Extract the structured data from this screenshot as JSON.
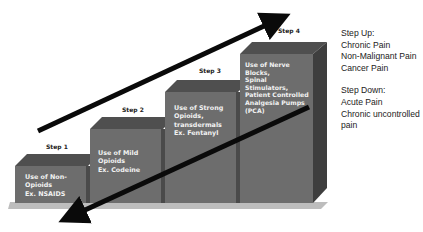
{
  "diagram": {
    "type": "staircase",
    "colors": {
      "front_face": "#6d6d6d",
      "top_face": "#4f4f4f",
      "side_face": "#3e3e3e",
      "base": "#bdbdbd",
      "arrow": "#0a0a0a",
      "block_text": "#f2f2f2"
    },
    "steps": [
      {
        "label": "Step 1",
        "lines": [
          "Use of Non-",
          "Opioids",
          "Ex. NSAIDS"
        ]
      },
      {
        "label": "Step 2",
        "lines": [
          "Use of Mild",
          "Opioids",
          "Ex. Codeine"
        ]
      },
      {
        "label": "Step 3",
        "lines": [
          "Use of Strong",
          "Opioids,",
          "transdermals",
          "Ex. Fentanyl"
        ]
      },
      {
        "label": "Step 4",
        "lines": [
          "Use of Nerve",
          "Blocks,",
          "Spinal",
          "Stimulators,",
          "Patient Controlled",
          "Analgesia Pumps",
          "(PCA)"
        ]
      }
    ],
    "arrows": [
      {
        "name": "step-up-arrow",
        "direction": "up"
      },
      {
        "name": "step-down-arrow",
        "direction": "down"
      }
    ]
  },
  "notes": {
    "step_up": {
      "title": "Step Up:",
      "items": [
        "Chronic Pain",
        "Non-Malignant Pain",
        "Cancer Pain"
      ]
    },
    "step_down": {
      "title": "Step Down:",
      "items": [
        "Acute Pain",
        "Chronic uncontrolled",
        "pain"
      ]
    }
  }
}
